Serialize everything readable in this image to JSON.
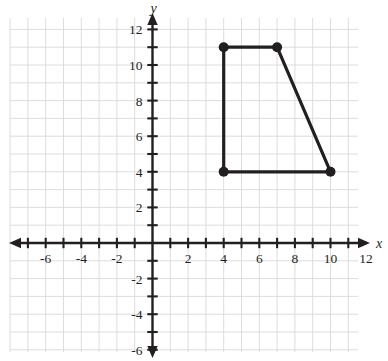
{
  "figure": {
    "kind": "coordinate-plane",
    "background_color": "#ffffff",
    "grid_color": "#d9d9da",
    "grid_minor_color": "#ebebec",
    "axis_color": "#231f20",
    "shape_color": "#231f20"
  },
  "axes": {
    "x_axis_label": "x",
    "y_axis_label": "y",
    "x_tick_labels": [
      "-6",
      "-4",
      "-2",
      "2",
      "4",
      "6",
      "8",
      "10",
      "12"
    ],
    "x_tick_values": [
      -6,
      -4,
      -2,
      2,
      4,
      6,
      8,
      10,
      12
    ],
    "y_tick_labels": [
      "12",
      "10",
      "8",
      "6",
      "4",
      "2",
      "-2",
      "-4",
      "-6"
    ],
    "y_tick_values": [
      12,
      10,
      8,
      6,
      4,
      2,
      -2,
      -4,
      -6
    ],
    "x_range": [
      -8,
      13
    ],
    "y_range": [
      -7,
      13
    ],
    "tick_interval": 1,
    "label_interval": 2
  },
  "chart_data": {
    "type": "scatter",
    "title": "",
    "xlabel": "x",
    "ylabel": "y",
    "xlim": [
      -8,
      13
    ],
    "ylim": [
      -7,
      13
    ],
    "grid": true,
    "legend": "none",
    "series": [
      {
        "name": "quadrilateral",
        "shape": "polygon",
        "closed": true,
        "marker": "filled-circle",
        "points": [
          {
            "x": 4,
            "y": 11,
            "label": "(4, 11)"
          },
          {
            "x": 7,
            "y": 11,
            "label": "(7, 11)"
          },
          {
            "x": 10,
            "y": 4,
            "label": "(10, 4)"
          },
          {
            "x": 4,
            "y": 4,
            "label": "(4, 4)"
          }
        ]
      }
    ]
  }
}
